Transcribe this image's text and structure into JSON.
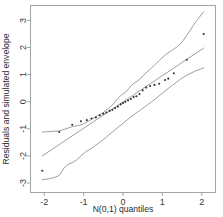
{
  "chart_data": {
    "type": "scatter",
    "title": "",
    "subtitle": "",
    "xlabel": "N(0,1) quantiles",
    "ylabel": "Residuals and simulated envelope",
    "xlim": [
      -2.35,
      2.35
    ],
    "ylim": [
      -3.35,
      3.55
    ],
    "grid": false,
    "legend": null,
    "legend_position": "none",
    "xticks": [
      -2,
      -1,
      0,
      1,
      2
    ],
    "xtick_labels": [
      "-2",
      "-1",
      "0",
      "1",
      "2"
    ],
    "yticks": [
      3,
      2,
      1,
      0,
      -1,
      -2,
      -3
    ],
    "ytick_labels": [
      "3",
      "2",
      "1",
      "0",
      "-1",
      "-2",
      "-3"
    ],
    "series": [
      {
        "name": "Residuals",
        "type": "scatter",
        "marker": "point",
        "x": [
          -2.05,
          -1.62,
          -1.29,
          -1.07,
          -0.92,
          -0.8,
          -0.69,
          -0.59,
          -0.5,
          -0.42,
          -0.34,
          -0.27,
          -0.2,
          -0.13,
          -0.06,
          0.0,
          0.06,
          0.13,
          0.2,
          0.27,
          0.34,
          0.42,
          0.5,
          0.59,
          0.69,
          0.8,
          0.92,
          1.07,
          1.15,
          1.29,
          1.62,
          2.05
        ],
        "y": [
          -2.55,
          -1.12,
          -0.85,
          -0.72,
          -0.68,
          -0.62,
          -0.58,
          -0.5,
          -0.44,
          -0.4,
          -0.34,
          -0.3,
          -0.23,
          -0.18,
          -0.1,
          -0.05,
          0.0,
          0.05,
          0.1,
          0.17,
          0.2,
          0.28,
          0.42,
          0.52,
          0.58,
          0.62,
          0.66,
          0.8,
          0.85,
          1.05,
          1.55,
          2.5
        ]
      },
      {
        "name": "Upper envelope",
        "type": "line",
        "x": [
          -2.05,
          -1.85,
          -1.62,
          -1.45,
          -1.29,
          -1.15,
          -1.07,
          -0.92,
          -0.8,
          -0.69,
          -0.59,
          -0.5,
          -0.42,
          -0.34,
          -0.27,
          -0.2,
          -0.13,
          -0.06,
          0.0,
          0.1,
          0.2,
          0.3,
          0.42,
          0.55,
          0.69,
          0.8,
          0.92,
          1.07,
          1.2,
          1.35,
          1.5,
          1.7,
          1.85,
          2.05
        ],
        "y": [
          -1.12,
          -1.1,
          -1.08,
          -1.0,
          -0.92,
          -0.88,
          -0.86,
          -0.76,
          -0.65,
          -0.55,
          -0.48,
          -0.4,
          -0.3,
          -0.22,
          -0.12,
          0.0,
          0.12,
          0.22,
          0.28,
          0.4,
          0.58,
          0.7,
          0.82,
          1.02,
          1.2,
          1.35,
          1.52,
          1.72,
          1.85,
          2.0,
          2.2,
          2.62,
          2.95,
          3.32
        ]
      },
      {
        "name": "Median envelope",
        "type": "line",
        "x": [
          -2.05,
          2.05
        ],
        "y": [
          -2.0,
          1.98
        ]
      },
      {
        "name": "Lower envelope",
        "type": "line",
        "x": [
          -2.05,
          -1.9,
          -1.75,
          -1.62,
          -1.5,
          -1.4,
          -1.29,
          -1.18,
          -1.07,
          -0.95,
          -0.8,
          -0.69,
          -0.59,
          -0.5,
          -0.38,
          -0.27,
          -0.13,
          0.0,
          0.15,
          0.3,
          0.45,
          0.6,
          0.75,
          0.92,
          1.07,
          1.25,
          1.45,
          1.62,
          1.82,
          2.05
        ],
        "y": [
          -2.88,
          -2.85,
          -2.8,
          -2.72,
          -2.45,
          -2.32,
          -2.25,
          -2.15,
          -2.0,
          -1.85,
          -1.72,
          -1.6,
          -1.5,
          -1.4,
          -1.25,
          -1.12,
          -0.95,
          -0.8,
          -0.62,
          -0.45,
          -0.3,
          -0.14,
          0.02,
          0.22,
          0.4,
          0.6,
          0.82,
          0.98,
          1.12,
          1.25
        ]
      }
    ],
    "colors": {
      "point": "#333333",
      "envelope": "#8c8c8c",
      "frame": "#9a9a9a",
      "background": "#ffffff"
    }
  },
  "axes": {
    "x_title": "N(0,1) quantiles",
    "y_title": "Residuals and simulated envelope"
  }
}
